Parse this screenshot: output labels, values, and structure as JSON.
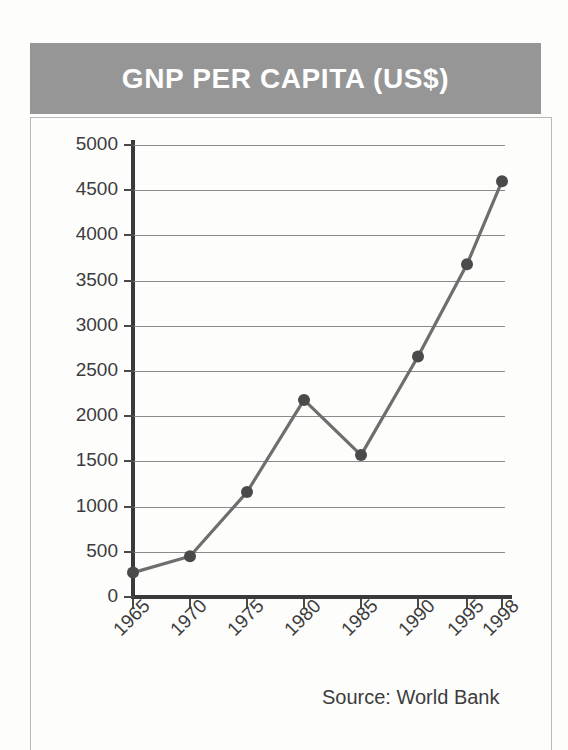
{
  "banner": {
    "title": "GNP PER CAPITA (US$)",
    "background_color": "#969696",
    "text_color": "#ffffff"
  },
  "source_note": "Source: World Bank",
  "chart_data": {
    "type": "line",
    "title": "GNP PER CAPITA (US$)",
    "xlabel": "",
    "ylabel": "",
    "categories": [
      "1965",
      "1970",
      "1975",
      "1980",
      "1985",
      "1990",
      "1995",
      "1998"
    ],
    "values": [
      270,
      450,
      1160,
      2180,
      1570,
      2660,
      3680,
      4600
    ],
    "ylim": [
      0,
      5000
    ],
    "ytick_labels": [
      "5000",
      "4500",
      "4000",
      "3500",
      "3000",
      "2500",
      "2000",
      "1500",
      "1000",
      "500",
      "0"
    ],
    "ytick_values": [
      5000,
      4500,
      4000,
      3500,
      3000,
      2500,
      2000,
      1500,
      1000,
      500,
      0
    ],
    "grid": true,
    "legend": "none",
    "line_color": "#6e6e6e",
    "marker_color": "#4a4a4a",
    "annotation": "Source: World Bank"
  }
}
